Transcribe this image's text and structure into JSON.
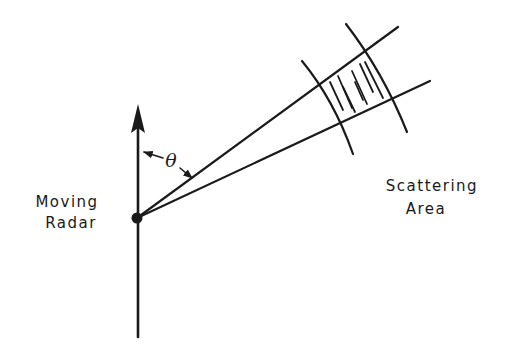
{
  "diagram": {
    "labels": {
      "radar_line1": "Moving",
      "radar_line2": "Radar",
      "area_line1": "Scattering",
      "area_line2": "Area",
      "angle": "θ"
    },
    "colors": {
      "ink": "#1a1a1a",
      "background": "#ffffff"
    },
    "elements": [
      {
        "id": "velocity-vector",
        "type": "arrow",
        "from": [
          138,
          337
        ],
        "to": [
          138,
          105
        ],
        "meaning": "radar direction of motion"
      },
      {
        "id": "radar-position",
        "type": "dot",
        "center": [
          137,
          218
        ]
      },
      {
        "id": "beam-upper-edge",
        "type": "line",
        "from": [
          137,
          218
        ],
        "to": [
          398,
          27
        ]
      },
      {
        "id": "beam-lower-edge",
        "type": "line",
        "from": [
          137,
          218
        ],
        "to": [
          430,
          81
        ]
      },
      {
        "id": "range-arc-near",
        "type": "arc",
        "from": [
          302,
          61
        ],
        "to": [
          353,
          154
        ]
      },
      {
        "id": "range-arc-far",
        "type": "arc",
        "from": [
          346,
          24
        ],
        "to": [
          407,
          132
        ]
      },
      {
        "id": "scattering-cell",
        "type": "hatched-region"
      },
      {
        "id": "angle-theta",
        "type": "angle-marker",
        "between": [
          "velocity-vector",
          "beam-upper-edge"
        ]
      }
    ]
  }
}
